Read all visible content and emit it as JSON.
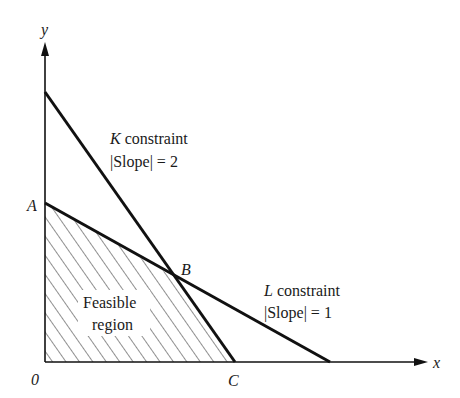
{
  "axes": {
    "x_label": "x",
    "y_label": "y",
    "origin_label": "0"
  },
  "points": {
    "A": "A",
    "B": "B",
    "C": "C"
  },
  "constraints": {
    "K": {
      "letter": "K",
      "word": " constraint",
      "slope_text": "|Slope| = 2"
    },
    "L": {
      "letter": "L",
      "word": " constraint",
      "slope_text": "|Slope| = 1"
    }
  },
  "region": {
    "line1": "Feasible",
    "line2": "region"
  },
  "colors": {
    "line": "#111111",
    "background": "#ffffff"
  }
}
